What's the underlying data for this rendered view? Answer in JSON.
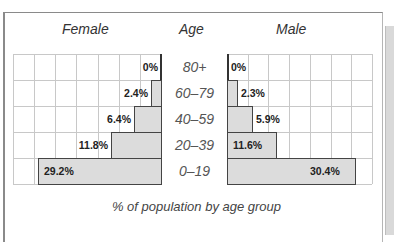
{
  "chart_data": {
    "type": "bar",
    "subtype": "population-pyramid",
    "title": "",
    "caption": "% of population by age group",
    "category_label": "Age",
    "categories": [
      "80+",
      "60–79",
      "40–59",
      "20–39",
      "0–19"
    ],
    "series": [
      {
        "name": "Female",
        "values": [
          0,
          2.4,
          6.4,
          11.8,
          29.2
        ],
        "labels": [
          "0%",
          "2.4%",
          "6.4%",
          "11.8%",
          "29.2%"
        ],
        "direction": "left"
      },
      {
        "name": "Male",
        "values": [
          0,
          2.3,
          5.9,
          11.6,
          30.4
        ],
        "labels": [
          "0%",
          "2.3%",
          "5.9%",
          "11.6%",
          "30.4%"
        ],
        "direction": "right"
      }
    ],
    "xlim": [
      0,
      35
    ],
    "grid": true,
    "bar_color": "#dcdcdc",
    "bar_edge_color": "#444444"
  },
  "headers": {
    "female": "Female",
    "age": "Age",
    "male": "Male"
  },
  "caption": "% of population by age group"
}
